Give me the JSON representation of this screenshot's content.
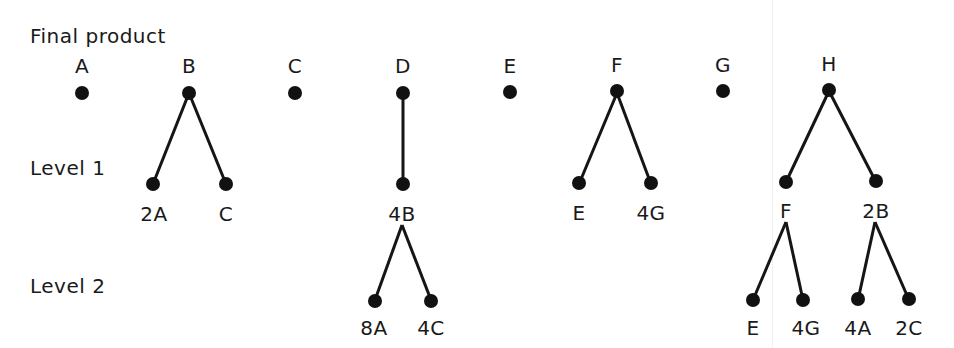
{
  "levels": {
    "final": "Final product",
    "level1": "Level 1",
    "level2": "Level 2"
  },
  "nodes": {
    "top": [
      {
        "label": "A",
        "x": 82
      },
      {
        "label": "B",
        "x": 189
      },
      {
        "label": "C",
        "x": 295
      },
      {
        "label": "D",
        "x": 403
      },
      {
        "label": "E",
        "x": 510
      },
      {
        "label": "F",
        "x": 617
      },
      {
        "label": "G",
        "x": 723
      },
      {
        "label": "H",
        "x": 829
      }
    ],
    "level1": [
      {
        "label": "2A",
        "x": 153,
        "parent": "B"
      },
      {
        "label": "C",
        "x": 226,
        "parent": "B"
      },
      {
        "label": "4B",
        "x": 403,
        "parent": "D"
      },
      {
        "label": "E",
        "x": 579,
        "parent": "F"
      },
      {
        "label": "4G",
        "x": 651,
        "parent": "F"
      },
      {
        "label": "F",
        "x": 786,
        "parent": "H"
      },
      {
        "label": "2B",
        "x": 876,
        "parent": "H"
      }
    ],
    "level2": [
      {
        "label": "8A",
        "x": 375,
        "parent": "4B"
      },
      {
        "label": "4C",
        "x": 431,
        "parent": "4B"
      },
      {
        "label": "E",
        "x": 753,
        "parent": "F"
      },
      {
        "label": "4G",
        "x": 803,
        "parent": "F"
      },
      {
        "label": "4A",
        "x": 858,
        "parent": "2B"
      },
      {
        "label": "2C",
        "x": 909,
        "parent": "2B"
      }
    ]
  },
  "colors": {
    "ink": "#111111",
    "background": "#ffffff"
  }
}
